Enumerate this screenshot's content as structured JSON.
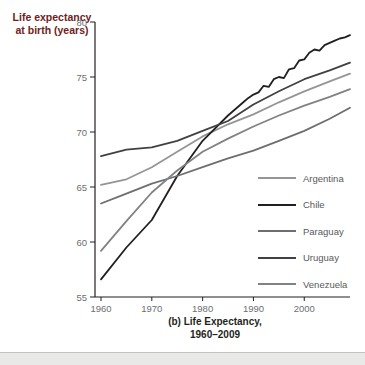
{
  "figure": {
    "y_axis_title_line1": "Life expectancy",
    "y_axis_title_line2": "at birth (years)",
    "y_axis_title_color": "#6e221c",
    "caption_line1": "(b) Life Expectancy,",
    "caption_line2": "1960–2009"
  },
  "chart_data": {
    "type": "line",
    "title": "(b) Life Expectancy, 1960–2009",
    "ylabel": "Life expectancy at birth (years)",
    "xlabel": "",
    "xlim": [
      1960,
      2009
    ],
    "ylim": [
      55,
      80
    ],
    "x_ticks": [
      "1960",
      "1970",
      "1980",
      "1990",
      "2000"
    ],
    "y_ticks": [
      "55",
      "60",
      "65",
      "70",
      "75",
      "80"
    ],
    "grid": false,
    "legend_position": "inside-lower-right",
    "axis_color": "#231f20",
    "tick_label_color": "#6d6e71",
    "series": [
      {
        "name": "Argentina",
        "color": "#939598",
        "points": [
          [
            1960,
            65.2
          ],
          [
            1965,
            65.7
          ],
          [
            1970,
            66.8
          ],
          [
            1975,
            68.2
          ],
          [
            1980,
            69.6
          ],
          [
            1985,
            70.7
          ],
          [
            1990,
            71.6
          ],
          [
            1995,
            72.7
          ],
          [
            2000,
            73.7
          ],
          [
            2005,
            74.6
          ],
          [
            2009,
            75.3
          ]
        ]
      },
      {
        "name": "Chile",
        "color": "#231f20",
        "points": [
          [
            1960,
            56.6
          ],
          [
            1965,
            59.5
          ],
          [
            1970,
            62.0
          ],
          [
            1975,
            66.0
          ],
          [
            1980,
            69.2
          ],
          [
            1985,
            71.5
          ],
          [
            1988,
            72.7
          ],
          [
            1989,
            73.1
          ],
          [
            1990,
            73.4
          ],
          [
            1991,
            73.6
          ],
          [
            1992,
            74.2
          ],
          [
            1993,
            74.1
          ],
          [
            1994,
            74.8
          ],
          [
            1995,
            75.0
          ],
          [
            1996,
            74.9
          ],
          [
            1997,
            75.7
          ],
          [
            1998,
            75.8
          ],
          [
            1999,
            76.5
          ],
          [
            2000,
            76.6
          ],
          [
            2001,
            77.2
          ],
          [
            2002,
            77.5
          ],
          [
            2003,
            77.4
          ],
          [
            2004,
            77.9
          ],
          [
            2005,
            78.1
          ],
          [
            2006,
            78.3
          ],
          [
            2007,
            78.5
          ],
          [
            2008,
            78.6
          ],
          [
            2009,
            78.8
          ]
        ]
      },
      {
        "name": "Paraguay",
        "color": "#6d6e71",
        "points": [
          [
            1960,
            63.5
          ],
          [
            1965,
            64.4
          ],
          [
            1970,
            65.3
          ],
          [
            1975,
            66.0
          ],
          [
            1980,
            66.8
          ],
          [
            1985,
            67.6
          ],
          [
            1990,
            68.3
          ],
          [
            1995,
            69.2
          ],
          [
            2000,
            70.1
          ],
          [
            2005,
            71.2
          ],
          [
            2009,
            72.2
          ]
        ]
      },
      {
        "name": "Uruguay",
        "color": "#414042",
        "points": [
          [
            1960,
            67.8
          ],
          [
            1965,
            68.4
          ],
          [
            1970,
            68.6
          ],
          [
            1975,
            69.2
          ],
          [
            1980,
            70.1
          ],
          [
            1985,
            71.0
          ],
          [
            1990,
            72.5
          ],
          [
            1995,
            73.7
          ],
          [
            2000,
            74.8
          ],
          [
            2005,
            75.6
          ],
          [
            2009,
            76.3
          ]
        ]
      },
      {
        "name": "Venezuela",
        "color": "#808285",
        "points": [
          [
            1960,
            59.2
          ],
          [
            1965,
            61.9
          ],
          [
            1970,
            64.5
          ],
          [
            1975,
            66.5
          ],
          [
            1980,
            68.2
          ],
          [
            1985,
            69.4
          ],
          [
            1990,
            70.5
          ],
          [
            1995,
            71.5
          ],
          [
            2000,
            72.4
          ],
          [
            2005,
            73.2
          ],
          [
            2009,
            73.9
          ]
        ]
      }
    ]
  }
}
